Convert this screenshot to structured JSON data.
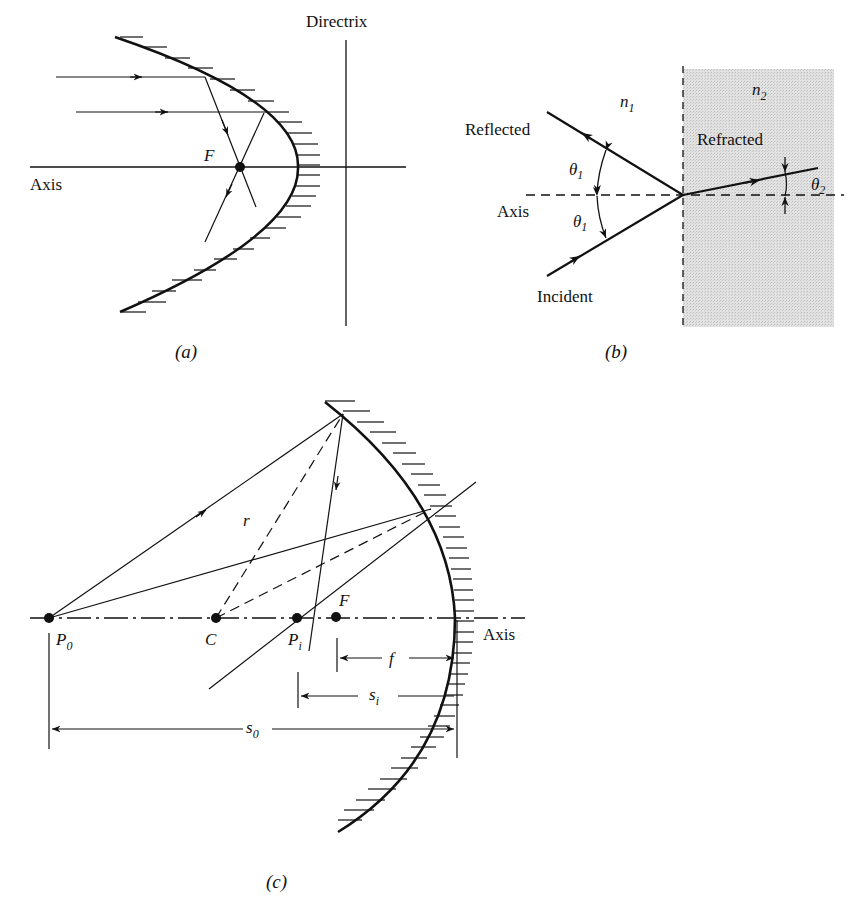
{
  "figure_a": {
    "caption": "(a)",
    "labels": {
      "directrix": "Directrix",
      "axis": "Axis",
      "focus": "F"
    }
  },
  "figure_b": {
    "caption": "(b)",
    "labels": {
      "n1": "n",
      "n1_sub": "1",
      "n2": "n",
      "n2_sub": "2",
      "reflected": "Reflected",
      "refracted": "Refracted",
      "incident": "Incident",
      "axis": "Axis",
      "theta1_top": "θ",
      "theta1_top_sub": "1",
      "theta1_bottom": "θ",
      "theta1_bottom_sub": "1",
      "theta2": "θ",
      "theta2_sub": "2"
    },
    "colors": {
      "medium2_fill": "#d9d9d9"
    }
  },
  "figure_c": {
    "caption": "(c)",
    "labels": {
      "p0": "P",
      "p0_sub": "0",
      "c": "C",
      "pi": "P",
      "pi_sub": "i",
      "f_point": "F",
      "radius": "r",
      "axis": "Axis",
      "f_dim": "f",
      "si": "s",
      "si_sub": "i",
      "so": "s",
      "so_sub": "0"
    }
  }
}
